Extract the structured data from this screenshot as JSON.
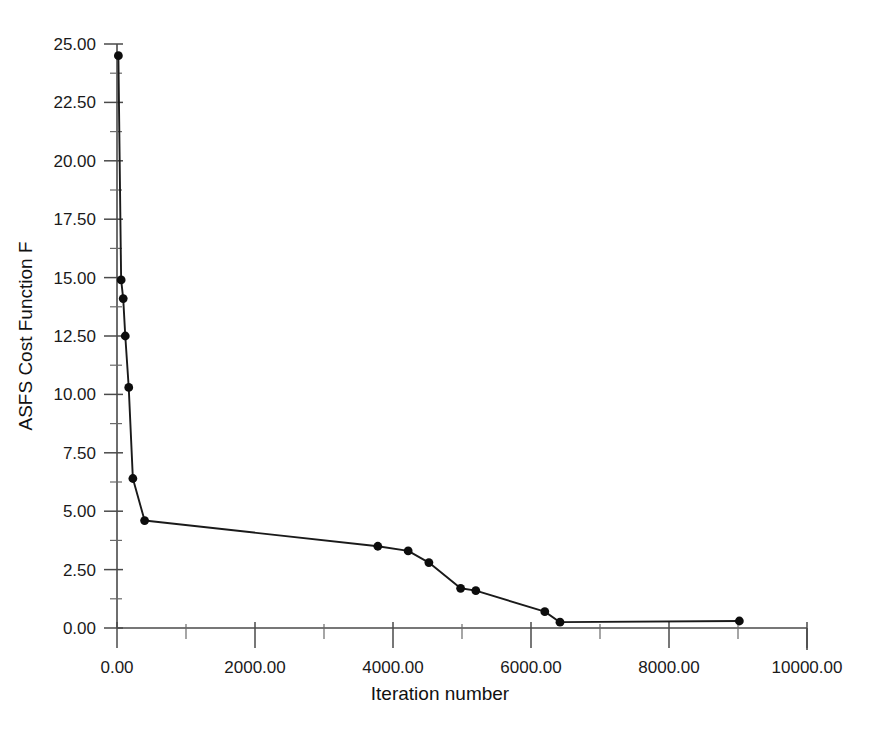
{
  "chart_data": {
    "type": "line",
    "title": "",
    "xlabel": "Iteration number",
    "ylabel": "ASFS Cost Function F",
    "xlim": [
      0,
      10000
    ],
    "ylim": [
      0,
      25
    ],
    "grid": false,
    "legend": null,
    "x_ticks": [
      0,
      2000,
      4000,
      6000,
      8000,
      10000
    ],
    "x_tick_labels": [
      "0.00",
      "2000.00",
      "4000.00",
      "6000.00",
      "8000.00",
      "10000.00"
    ],
    "x_minor_ticks": [
      1000,
      3000,
      5000,
      7000,
      9000
    ],
    "y_ticks": [
      0,
      2.5,
      5,
      7.5,
      10,
      12.5,
      15,
      17.5,
      20,
      22.5,
      25
    ],
    "y_tick_labels": [
      "0.00",
      "2.50",
      "5.00",
      "7.50",
      "10.00",
      "12.50",
      "15.00",
      "17.50",
      "20.00",
      "22.50",
      "25.00"
    ],
    "y_minor_ticks": [
      1.25,
      3.75,
      6.25,
      8.75,
      11.25,
      13.75,
      16.25,
      18.75,
      21.25,
      23.75
    ],
    "series": [
      {
        "name": "ASFS Cost Function F",
        "marker": "filled-circle",
        "x": [
          20,
          60,
          90,
          120,
          170,
          230,
          400,
          3780,
          4220,
          4520,
          4980,
          5200,
          6200,
          6420,
          9020
        ],
        "y": [
          24.5,
          14.9,
          14.1,
          12.5,
          10.3,
          6.4,
          4.6,
          3.5,
          3.3,
          2.8,
          1.7,
          1.6,
          0.7,
          0.25,
          0.3
        ]
      }
    ]
  },
  "axes": {
    "x_axis_name": "Iteration number",
    "y_axis_name": "ASFS Cost Function F"
  }
}
